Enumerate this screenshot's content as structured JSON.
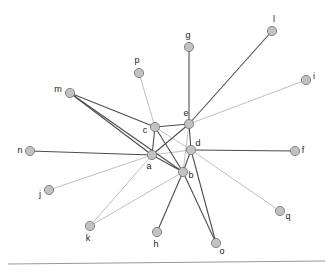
{
  "figure": {
    "type": "node-link-diagram",
    "background_color": "#ffffff",
    "node_fill_color": "#c2c2c2",
    "node_stroke_color": "#7b7b7b",
    "node_radius": 4.6,
    "edge_color_strong": "#4d4d4d",
    "edge_color_light": "#a8a8a8",
    "label_color": "#1a1a1a",
    "baseline_rule_color": "#999999"
  },
  "chart_data": {
    "type": "scatter",
    "title": "",
    "xlabel": "",
    "ylabel": "",
    "grid": false,
    "legend": "none",
    "xlim": [
      0,
      332
    ],
    "ylim": [
      276,
      0
    ],
    "nodes": [
      {
        "id": "a",
        "x": 152,
        "y": 155,
        "label": "a",
        "label_dx": -3,
        "label_dy": 12,
        "degree": 11
      },
      {
        "id": "b",
        "x": 183,
        "y": 172,
        "label": "b",
        "label_dx": 8,
        "label_dy": 4,
        "degree": 10
      },
      {
        "id": "c",
        "x": 155,
        "y": 127,
        "label": "c",
        "label_dx": -10,
        "label_dy": 4,
        "degree": 6
      },
      {
        "id": "d",
        "x": 191,
        "y": 150,
        "label": "d",
        "label_dx": 7,
        "label_dy": -6,
        "degree": 8
      },
      {
        "id": "e",
        "x": 189,
        "y": 124,
        "label": "e",
        "label_dx": -3,
        "label_dy": -10,
        "degree": 9
      },
      {
        "id": "f",
        "x": 295,
        "y": 151,
        "label": "f",
        "label_dx": 8,
        "label_dy": 0,
        "degree": 1
      },
      {
        "id": "g",
        "x": 189,
        "y": 47,
        "label": "g",
        "label_dx": -1,
        "label_dy": -11,
        "degree": 1
      },
      {
        "id": "h",
        "x": 157,
        "y": 232,
        "label": "h",
        "label_dx": -1,
        "label_dy": 13,
        "degree": 1
      },
      {
        "id": "i",
        "x": 306,
        "y": 80,
        "label": "i",
        "label_dx": 8,
        "label_dy": -3,
        "degree": 1
      },
      {
        "id": "j",
        "x": 49,
        "y": 190,
        "label": "j",
        "label_dx": -9,
        "label_dy": 5,
        "degree": 1
      },
      {
        "id": "k",
        "x": 90,
        "y": 226,
        "label": "k",
        "label_dx": -2,
        "label_dy": 13,
        "degree": 2
      },
      {
        "id": "l",
        "x": 272,
        "y": 31,
        "label": "l",
        "label_dx": 2,
        "label_dy": -11,
        "degree": 1
      },
      {
        "id": "m",
        "x": 70,
        "y": 93,
        "label": "m",
        "label_dx": -12,
        "label_dy": -3,
        "degree": 3
      },
      {
        "id": "n",
        "x": 30,
        "y": 151,
        "label": "n",
        "label_dx": -10,
        "label_dy": 0,
        "degree": 1
      },
      {
        "id": "o",
        "x": 216,
        "y": 243,
        "label": "o",
        "label_dx": 6,
        "label_dy": 9,
        "degree": 2
      },
      {
        "id": "p",
        "x": 139,
        "y": 73,
        "label": "p",
        "label_dx": -2,
        "label_dy": -12,
        "degree": 1
      },
      {
        "id": "q",
        "x": 280,
        "y": 211,
        "label": "q",
        "label_dx": 8,
        "label_dy": 6,
        "degree": 1
      }
    ],
    "edges": [
      {
        "source": "a",
        "target": "b",
        "weight": "strong"
      },
      {
        "source": "a",
        "target": "c",
        "weight": "strong"
      },
      {
        "source": "a",
        "target": "d",
        "weight": "light"
      },
      {
        "source": "a",
        "target": "e",
        "weight": "strong"
      },
      {
        "source": "b",
        "target": "c",
        "weight": "strong"
      },
      {
        "source": "b",
        "target": "d",
        "weight": "strong"
      },
      {
        "source": "b",
        "target": "e",
        "weight": "light"
      },
      {
        "source": "c",
        "target": "d",
        "weight": "light"
      },
      {
        "source": "c",
        "target": "e",
        "weight": "strong"
      },
      {
        "source": "d",
        "target": "e",
        "weight": "strong"
      },
      {
        "source": "d",
        "target": "f",
        "weight": "strong"
      },
      {
        "source": "e",
        "target": "g",
        "weight": "strong"
      },
      {
        "source": "b",
        "target": "h",
        "weight": "strong"
      },
      {
        "source": "e",
        "target": "i",
        "weight": "light"
      },
      {
        "source": "a",
        "target": "j",
        "weight": "light"
      },
      {
        "source": "a",
        "target": "k",
        "weight": "light"
      },
      {
        "source": "b",
        "target": "k",
        "weight": "light"
      },
      {
        "source": "e",
        "target": "l",
        "weight": "strong"
      },
      {
        "source": "m",
        "target": "c",
        "weight": "strong"
      },
      {
        "source": "m",
        "target": "a",
        "weight": "strong"
      },
      {
        "source": "m",
        "target": "b",
        "weight": "strong"
      },
      {
        "source": "a",
        "target": "n",
        "weight": "strong"
      },
      {
        "source": "b",
        "target": "o",
        "weight": "strong"
      },
      {
        "source": "d",
        "target": "o",
        "weight": "strong"
      },
      {
        "source": "c",
        "target": "p",
        "weight": "light"
      },
      {
        "source": "d",
        "target": "q",
        "weight": "light"
      }
    ],
    "annotations": [
      {
        "name": "baseline-rule",
        "x1": 8,
        "y1": 264,
        "x2": 325,
        "y2": 261
      }
    ]
  }
}
